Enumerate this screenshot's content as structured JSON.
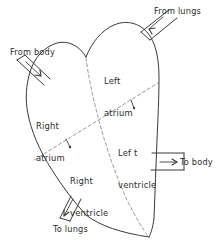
{
  "diagram": {
    "style": {
      "background": "#ffffff",
      "ink": "#3a3a3a",
      "dashed_ink": "#8a8a8a",
      "text": "#2b2b2b"
    },
    "chambers": [
      {
        "id": "right-atrium",
        "line1": "Right",
        "line2": "atrium",
        "x": 36,
        "y": 100
      },
      {
        "id": "left-atrium",
        "line1": "Left",
        "line2": "atrium",
        "x": 104,
        "y": 55
      },
      {
        "id": "right-ventricle",
        "line1": "Right",
        "line2": "ventricle",
        "x": 70,
        "y": 155
      },
      {
        "id": "left-ventricle",
        "line1": "Lef t",
        "line2": "ventricle",
        "x": 118,
        "y": 127
      }
    ],
    "vessels": [
      {
        "id": "from-lungs",
        "label": "From lungs",
        "direction": "in",
        "x": 154,
        "y": 6
      },
      {
        "id": "from-body",
        "label": "From body",
        "direction": "in",
        "x": 10,
        "y": 47
      },
      {
        "id": "to-body",
        "label": "To body",
        "direction": "out",
        "x": 180,
        "y": 157
      },
      {
        "id": "to-lungs",
        "label": "To lungs",
        "direction": "out",
        "x": 53,
        "y": 224
      }
    ]
  }
}
